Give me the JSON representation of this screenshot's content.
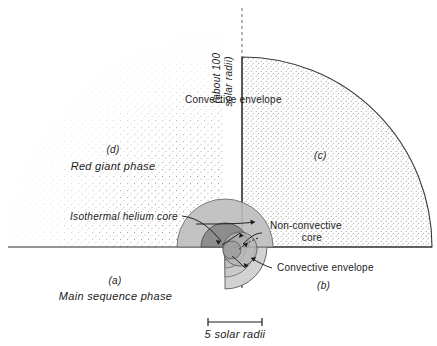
{
  "figure": {
    "title_present": false,
    "quadrant_labels": {
      "a": "(a)",
      "a_caption": "Main sequence phase",
      "b": "(b)",
      "c": "(c)",
      "d": "(d)",
      "d_caption": "Red giant phase"
    },
    "annotations": {
      "axis_note_line1": "(about 100",
      "axis_note_line2": "solar radii)",
      "convective_envelope_top": "Convective  envelope",
      "isothermal_helium_core": "Isothermal  helium  core",
      "non_convective_core_line1": "Non-convective",
      "non_convective_core_line2": "core",
      "convective_envelope_bottom": "Convective  envelope"
    },
    "scale_bar": {
      "label": "5 solar radii",
      "length_px": 54
    },
    "colors": {
      "ink": "#1b1b1b",
      "outline": "#3a3a3a",
      "stipple_light": "#9a9a9a",
      "core_outer_gray": "#b9b9b9",
      "core_inner_gray": "#8e8e8e",
      "envelope_gray": "#cfcfcf",
      "background": "#ffffff"
    },
    "geometry": {
      "center_x": 225,
      "center_y": 247,
      "baseline_y": 247,
      "axis_x": 242,
      "red_giant_radius": 232,
      "quadrant_c_radius": 190
    }
  }
}
